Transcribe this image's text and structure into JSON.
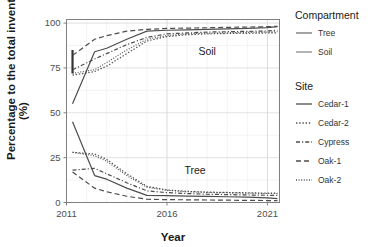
{
  "chart_data": {
    "type": "line",
    "title": "",
    "xlabel": "Year",
    "ylabel": "Percentage to the total inventory (%)",
    "xlim": [
      2011,
      2021.6
    ],
    "ylim": [
      0,
      102
    ],
    "xticks": [
      2011,
      2016,
      2021
    ],
    "xtick_labels": [
      "2011",
      "2016",
      "2021"
    ],
    "yticks": [
      0,
      25,
      50,
      75,
      100
    ],
    "ytick_labels": [
      "0",
      "25",
      "50",
      "75",
      "100"
    ],
    "grid": true,
    "grid_minor": true,
    "legend_position": "right",
    "panel_annotations": [
      {
        "text": "Soil",
        "x": 2018.0,
        "y": 82
      },
      {
        "text": "Tree",
        "x": 2017.4,
        "y": 16
      }
    ],
    "error_bar": {
      "x": 2011.3,
      "y_low": 72,
      "y_high": 85,
      "color": "#333333"
    },
    "x": [
      2011.3,
      2012.4,
      2013.0,
      2014.0,
      2015.0,
      2016.0,
      2017.0,
      2018.0,
      2019.0,
      2020.0,
      2021.0,
      2021.5
    ],
    "series": [
      {
        "name": "Soil Cedar-1",
        "compartment": "Soil",
        "site": "Cedar-1",
        "dash": "none",
        "color": "#4d4d4d",
        "width": 1.2,
        "values": [
          55,
          84,
          86,
          91,
          95.5,
          96,
          96.2,
          96.5,
          96.8,
          97,
          97.5,
          98
        ]
      },
      {
        "name": "Soil Cedar-2",
        "compartment": "Soil",
        "site": "Cedar-2",
        "dash": "1.4,1.8",
        "color": "#4d4d4d",
        "width": 1.2,
        "values": [
          71,
          73,
          76,
          83,
          90,
          92.5,
          93.5,
          94,
          94.2,
          94.3,
          94.5,
          94.6
        ]
      },
      {
        "name": "Soil Cypress",
        "compartment": "Soil",
        "site": "Cypress",
        "dash": "4,2,1.2,2",
        "color": "#4d4d4d",
        "width": 1.2,
        "values": [
          74,
          80,
          83,
          88,
          92,
          94,
          94.5,
          95,
          95.2,
          95.4,
          95.6,
          96
        ]
      },
      {
        "name": "Soil Oak-1",
        "compartment": "Soil",
        "site": "Oak-1",
        "dash": "5,3",
        "color": "#4d4d4d",
        "width": 1.2,
        "values": [
          82,
          91,
          93,
          95.5,
          96.5,
          97,
          97.2,
          97.4,
          97.6,
          97.8,
          98,
          98.2
        ]
      },
      {
        "name": "Soil Oak-2",
        "compartment": "Soil",
        "site": "Oak-2",
        "dash": "1,1.6",
        "color": "#4d4d4d",
        "width": 1.1,
        "values": [
          72,
          74,
          78,
          85,
          91,
          93,
          94,
          94.4,
          94.6,
          94.8,
          95,
          95.2
        ]
      },
      {
        "name": "Tree Cedar-1",
        "compartment": "Tree",
        "site": "Cedar-1",
        "dash": "none",
        "color": "#4d4d4d",
        "width": 1.2,
        "values": [
          45,
          15,
          13,
          8,
          4,
          3.8,
          3.6,
          3.4,
          3.2,
          3,
          2.6,
          2.2
        ]
      },
      {
        "name": "Tree Cedar-2",
        "compartment": "Tree",
        "site": "Cedar-2",
        "dash": "1.4,1.8",
        "color": "#4d4d4d",
        "width": 1.2,
        "values": [
          28,
          27,
          24,
          16,
          9,
          7,
          6.2,
          5.8,
          5.6,
          5.4,
          5.2,
          5.2
        ]
      },
      {
        "name": "Tree Cypress",
        "compartment": "Tree",
        "site": "Cypress",
        "dash": "4,2,1.2,2",
        "color": "#4d4d4d",
        "width": 1.2,
        "values": [
          18,
          19,
          16,
          11,
          6.5,
          5.5,
          5,
          4.6,
          4.4,
          4.2,
          4,
          4
        ]
      },
      {
        "name": "Tree Oak-1",
        "compartment": "Tree",
        "site": "Oak-1",
        "dash": "5,3",
        "color": "#4d4d4d",
        "width": 1.2,
        "values": [
          17,
          8,
          6,
          3.5,
          1.8,
          1.6,
          1.5,
          1.4,
          1.3,
          1.2,
          1.1,
          1
        ]
      },
      {
        "name": "Tree Oak-2",
        "compartment": "Tree",
        "site": "Oak-2",
        "dash": "1,1.6",
        "color": "#4d4d4d",
        "width": 1.1,
        "values": [
          28,
          26,
          23,
          15,
          8.5,
          6.8,
          6,
          5.6,
          5.4,
          5.2,
          5,
          5
        ]
      }
    ]
  },
  "legend": {
    "compartment": {
      "title": "Compartment",
      "items": [
        {
          "label": "Tree",
          "color": "#737373",
          "dash": "none"
        },
        {
          "label": "Soil",
          "color": "#8c8c8c",
          "dash": "none"
        }
      ]
    },
    "site": {
      "title": "Site",
      "items": [
        {
          "label": "Cedar-1",
          "dash": "none"
        },
        {
          "label": "Cedar-2",
          "dash": "1.4,1.8"
        },
        {
          "label": "Cypress",
          "dash": "4,2,1.2,2"
        },
        {
          "label": "Oak-1",
          "dash": "5,3"
        },
        {
          "label": "Oak-2",
          "dash": "1,1.6"
        }
      ]
    }
  },
  "colors": {
    "panel_border": "#808080",
    "grid_major": "#d9d9d9",
    "grid_minor": "#ececec",
    "line": "#4d4d4d",
    "text": "#1a1a1a",
    "tick_text": "#4d4d4d"
  }
}
